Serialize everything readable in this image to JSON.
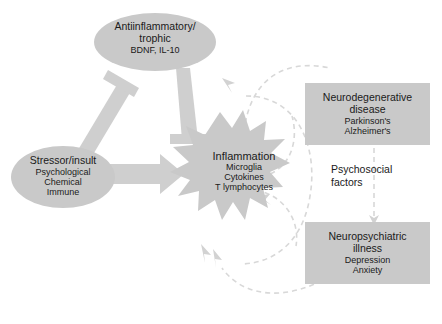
{
  "figure": {
    "type": "conceptual-flow-diagram",
    "background_color": "#ffffff",
    "shape_fill_color": "#c9c9c9",
    "arrow_fill_color": "#cfcfcf",
    "dashed_arrow_color": "#d5d5d5",
    "text_color": "#1a1a1a"
  },
  "nodes": {
    "antiinflammatory": {
      "shape": "ellipse",
      "title": "Antiinflammatory/",
      "title2": "trophic",
      "subtitle": "BDNF, IL-10"
    },
    "stressor": {
      "shape": "ellipse",
      "title": "Stressor/insult",
      "sub1": "Psychological",
      "sub2": "Chemical",
      "sub3": "Immune"
    },
    "inflammation": {
      "shape": "starburst",
      "title": "Inflammation",
      "sub1": "Microglia",
      "sub2": "Cytokines",
      "sub3": "T lymphocytes"
    },
    "neurodegenerative": {
      "shape": "rectangle",
      "title": "Neurodegenerative",
      "title2": "disease",
      "sub1": "Parkinson's",
      "sub2": "Alzheimer's"
    },
    "neuropsychiatric": {
      "shape": "rectangle",
      "title": "Neuropsychiatric",
      "title2": "illness",
      "sub1": "Depression",
      "sub2": "Anxiety"
    }
  },
  "labels": {
    "psychosocial_line1": "Psychosocial",
    "psychosocial_line2": "factors"
  },
  "connectors": [
    {
      "name": "stressor-inhibits-antiinflammatory",
      "style": "solid-blunt-end",
      "from": "stressor",
      "to": "antiinflammatory"
    },
    {
      "name": "antiinflammatory-inhibits-inflammation",
      "style": "solid-blunt-end",
      "from": "antiinflammatory",
      "to": "inflammation"
    },
    {
      "name": "stressor-drives-inflammation",
      "style": "solid-arrow",
      "from": "stressor",
      "to": "inflammation"
    },
    {
      "name": "inflammation-to-neurodegenerative",
      "style": "dashed-arrow",
      "from": "inflammation",
      "to": "neurodegenerative"
    },
    {
      "name": "neurodegenerative-to-inflammation",
      "style": "dashed-arrow",
      "from": "neurodegenerative",
      "to": "inflammation"
    },
    {
      "name": "inflammation-to-neuropsychiatric",
      "style": "dashed-arrow",
      "from": "inflammation",
      "to": "neuropsychiatric"
    },
    {
      "name": "neuropsychiatric-to-inflammation",
      "style": "dashed-arrow",
      "from": "neuropsychiatric",
      "to": "inflammation"
    },
    {
      "name": "neurodegenerative-to-neuropsychiatric",
      "style": "dashed-arrow-vertical",
      "from": "neurodegenerative",
      "to": "neuropsychiatric"
    }
  ]
}
